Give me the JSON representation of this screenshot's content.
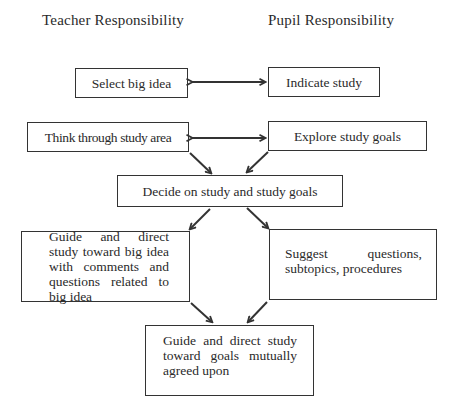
{
  "headings": {
    "teacher": "Teacher Responsibility",
    "pupil": "Pupil Responsibility"
  },
  "nodes": {
    "select_big_idea": "Select big idea",
    "indicate_study": "Indicate study",
    "think_through": "Think through study area",
    "explore_goals": "Explore study goals",
    "decide": "Decide on study and study goals",
    "guide_big_idea": "Guide and direct study toward big idea with comments and questions related to big idea",
    "suggest": "Suggest questions, subtopics, procedures",
    "guide_goals": "Guide and direct study toward goals mutually agreed upon"
  },
  "edges": [
    {
      "from": "select_big_idea",
      "to": "indicate_study",
      "type": "bidirectional"
    },
    {
      "from": "think_through",
      "to": "explore_goals",
      "type": "bidirectional"
    },
    {
      "from": "think_through",
      "to": "decide",
      "type": "directed"
    },
    {
      "from": "explore_goals",
      "to": "decide",
      "type": "directed"
    },
    {
      "from": "decide",
      "to": "guide_big_idea",
      "type": "directed"
    },
    {
      "from": "decide",
      "to": "suggest",
      "type": "directed"
    },
    {
      "from": "guide_big_idea",
      "to": "guide_goals",
      "type": "directed"
    },
    {
      "from": "suggest",
      "to": "guide_goals",
      "type": "directed"
    }
  ]
}
